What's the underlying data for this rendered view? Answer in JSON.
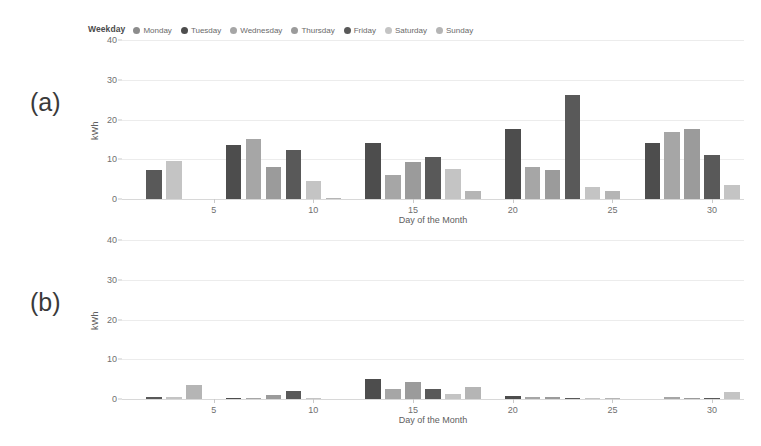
{
  "legend": {
    "title": "Weekday",
    "items": [
      {
        "label": "Monday",
        "color": "#8c8c8c"
      },
      {
        "label": "Tuesday",
        "color": "#4d4d4d"
      },
      {
        "label": "Wednesday",
        "color": "#a6a6a6"
      },
      {
        "label": "Thursday",
        "color": "#9b9b9b"
      },
      {
        "label": "Friday",
        "color": "#595959"
      },
      {
        "label": "Saturday",
        "color": "#c4c4c4"
      },
      {
        "label": "Sunday",
        "color": "#b5b5b5"
      }
    ]
  },
  "panels": {
    "a": {
      "tag": "(a)",
      "ylabel": "kWh"
    },
    "b": {
      "tag": "(b)",
      "ylabel": "kWh"
    }
  },
  "chart_data": [
    {
      "type": "bar",
      "panel": "(a)",
      "title": "",
      "xlabel": "Day of the Month",
      "ylabel": "kWh",
      "ylim": [
        0,
        40
      ],
      "yticks": [
        0,
        10,
        20,
        30,
        40
      ],
      "xticks": [
        5,
        10,
        15,
        20,
        25,
        30
      ],
      "xlim": [
        0.4,
        31.6
      ],
      "grid": true,
      "legend_position": "top",
      "categories": [
        1,
        2,
        3,
        4,
        5,
        6,
        7,
        8,
        9,
        10,
        11,
        12,
        13,
        14,
        15,
        16,
        17,
        18,
        19,
        20,
        21,
        22,
        23,
        24,
        25,
        26,
        27,
        28,
        29,
        30,
        31
      ],
      "weekday": [
        "Thursday",
        "Friday",
        "Saturday",
        "Sunday",
        "Monday",
        "Tuesday",
        "Wednesday",
        "Thursday",
        "Friday",
        "Saturday",
        "Sunday",
        "Monday",
        "Tuesday",
        "Wednesday",
        "Thursday",
        "Friday",
        "Saturday",
        "Sunday",
        "Monday",
        "Tuesday",
        "Wednesday",
        "Thursday",
        "Friday",
        "Saturday",
        "Sunday",
        "Monday",
        "Tuesday",
        "Wednesday",
        "Thursday",
        "Friday",
        "Saturday"
      ],
      "values": [
        0,
        7.3,
        9.4,
        0,
        0,
        13.6,
        14.9,
        8.0,
        12.3,
        4.6,
        0.3,
        0,
        13.9,
        6.0,
        9.2,
        10.5,
        7.4,
        1.9,
        0,
        17.4,
        8.0,
        7.3,
        26.0,
        2.9,
        1.9,
        0,
        14.0,
        16.8,
        17.4,
        11.0,
        3.4
      ],
      "bar_colors": [
        "#9b9b9b",
        "#595959",
        "#c4c4c4",
        "#b5b5b5",
        "#8c8c8c",
        "#4d4d4d",
        "#a6a6a6",
        "#9b9b9b",
        "#595959",
        "#c4c4c4",
        "#b5b5b5",
        "#8c8c8c",
        "#4d4d4d",
        "#a6a6a6",
        "#9b9b9b",
        "#595959",
        "#c4c4c4",
        "#b5b5b5",
        "#8c8c8c",
        "#4d4d4d",
        "#a6a6a6",
        "#9b9b9b",
        "#595959",
        "#c4c4c4",
        "#b5b5b5",
        "#8c8c8c",
        "#4d4d4d",
        "#a6a6a6",
        "#9b9b9b",
        "#595959",
        "#c4c4c4"
      ]
    },
    {
      "type": "bar",
      "panel": "(b)",
      "title": "",
      "xlabel": "Day of the Month",
      "ylabel": "kWh",
      "ylim": [
        0,
        40
      ],
      "yticks": [
        0,
        10,
        20,
        30,
        40
      ],
      "xticks": [
        5,
        10,
        15,
        20,
        25,
        30
      ],
      "xlim": [
        0.4,
        31.6
      ],
      "grid": true,
      "legend_position": "none",
      "categories": [
        1,
        2,
        3,
        4,
        5,
        6,
        7,
        8,
        9,
        10,
        11,
        12,
        13,
        14,
        15,
        16,
        17,
        18,
        19,
        20,
        21,
        22,
        23,
        24,
        25,
        26,
        27,
        28,
        29,
        30,
        31
      ],
      "weekday": [
        "Thursday",
        "Friday",
        "Saturday",
        "Sunday",
        "Monday",
        "Tuesday",
        "Wednesday",
        "Thursday",
        "Friday",
        "Saturday",
        "Sunday",
        "Monday",
        "Tuesday",
        "Wednesday",
        "Thursday",
        "Friday",
        "Saturday",
        "Sunday",
        "Monday",
        "Tuesday",
        "Wednesday",
        "Thursday",
        "Friday",
        "Saturday",
        "Sunday",
        "Monday",
        "Tuesday",
        "Wednesday",
        "Thursday",
        "Friday",
        "Saturday"
      ],
      "values": [
        0,
        0.5,
        0.4,
        3.6,
        0,
        0.3,
        0.3,
        1.0,
        1.9,
        0.2,
        0,
        0,
        4.9,
        2.4,
        4.2,
        2.4,
        1.2,
        2.9,
        0,
        0.8,
        0.5,
        0.4,
        0.3,
        0.3,
        0.3,
        0,
        0,
        0.6,
        0.3,
        0.2,
        1.7
      ],
      "bar_colors": [
        "#9b9b9b",
        "#595959",
        "#c4c4c4",
        "#b5b5b5",
        "#8c8c8c",
        "#4d4d4d",
        "#a6a6a6",
        "#9b9b9b",
        "#595959",
        "#c4c4c4",
        "#b5b5b5",
        "#8c8c8c",
        "#4d4d4d",
        "#a6a6a6",
        "#9b9b9b",
        "#595959",
        "#c4c4c4",
        "#b5b5b5",
        "#8c8c8c",
        "#4d4d4d",
        "#a6a6a6",
        "#9b9b9b",
        "#595959",
        "#c4c4c4",
        "#b5b5b5",
        "#8c8c8c",
        "#4d4d4d",
        "#a6a6a6",
        "#9b9b9b",
        "#595959",
        "#c4c4c4"
      ]
    }
  ]
}
